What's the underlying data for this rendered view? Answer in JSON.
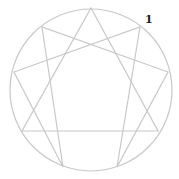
{
  "diagram": {
    "type": "enneagram",
    "stroke_color": "#c8c8c8",
    "label_color": "#222222",
    "circle": {
      "cx": 91,
      "cy": 90,
      "r": 81
    },
    "labels": [
      {
        "text": "1",
        "x": 145,
        "y": 13
      }
    ],
    "points": {
      "9": [
        91,
        8
      ],
      "1": [
        140,
        27
      ],
      "2": [
        168,
        72
      ],
      "3": [
        158,
        131
      ],
      "4": [
        117,
        167
      ],
      "5": [
        63,
        167
      ],
      "6": [
        22,
        131
      ],
      "7": [
        14,
        72
      ],
      "8": [
        42,
        27
      ]
    },
    "triangle": [
      "9",
      "3",
      "6"
    ],
    "hexad": [
      "1",
      "4",
      "2",
      "8",
      "5",
      "7"
    ]
  }
}
